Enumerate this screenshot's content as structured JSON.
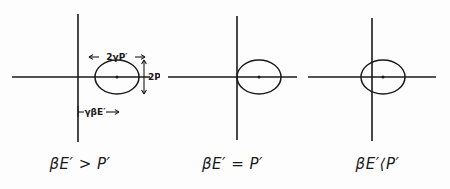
{
  "figure": {
    "background_color": "#fdfdfd",
    "ink_color": "#1a1a1a",
    "panel_count": 3
  },
  "panels": [
    {
      "id": "panel-1",
      "caption": "βE′ > P′",
      "condition": "beta-E-prime-greater-than-P-prime",
      "axes": {
        "x_axis_label": "",
        "y_axis_label": "",
        "origin_x": 78,
        "origin_y": 77
      },
      "ellipse": {
        "center_x": 117,
        "center_y": 77,
        "semi_axis_x": 22,
        "semi_axis_y": 17,
        "center_marker": true
      },
      "annotations": [
        {
          "name": "width-label",
          "text": "2γP′",
          "arrow_style": "double-headed-horizontal",
          "position": "above-ellipse"
        },
        {
          "name": "height-label",
          "text": "2P′",
          "arrow_style": "double-headed-vertical",
          "position": "right-of-ellipse"
        },
        {
          "name": "offset-label",
          "text": "γβE′",
          "arrow_style": "horizontal-from-axis-to-center",
          "position": "below-axis"
        }
      ]
    },
    {
      "id": "panel-2",
      "caption": "βE′ = P′",
      "condition": "beta-E-prime-equals-P-prime",
      "axes": {
        "x_axis_label": "",
        "y_axis_label": "",
        "origin_x": 237,
        "origin_y": 77
      },
      "ellipse": {
        "center_x": 259,
        "center_y": 77,
        "semi_axis_x": 22,
        "semi_axis_y": 17,
        "center_marker": true
      },
      "annotations": []
    },
    {
      "id": "panel-3",
      "caption": "βE′⟨P′",
      "condition": "beta-E-prime-less-than-P-prime",
      "axes": {
        "x_axis_label": "",
        "y_axis_label": "",
        "origin_x": 372,
        "origin_y": 77
      },
      "ellipse": {
        "center_x": 383,
        "center_y": 77,
        "semi_axis_x": 22,
        "semi_axis_y": 17,
        "center_marker": true
      },
      "annotations": []
    }
  ]
}
